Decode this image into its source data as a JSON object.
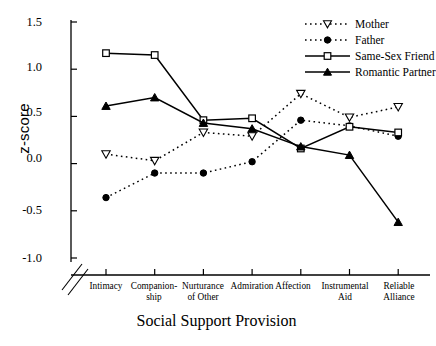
{
  "chart_data": {
    "type": "line",
    "title": "",
    "xlabel": "Social Support Provision",
    "ylabel": "z-score",
    "categories": [
      "Intimacy",
      "Companion-ship",
      "Nurturance of Other",
      "Admiration",
      "Affection",
      "Instrumental Aid",
      "Reliable Alliance"
    ],
    "category_lines": [
      [
        "Intimacy"
      ],
      [
        "Companion-",
        "ship"
      ],
      [
        "Nurturance",
        "of Other"
      ],
      [
        "Admiration"
      ],
      [
        "Affection"
      ],
      [
        "Instrumental",
        "Aid"
      ],
      [
        "Reliable",
        "Alliance"
      ]
    ],
    "ylim": [
      -1.0,
      1.5
    ],
    "yticks": [
      "1.5",
      "1.0",
      "0.5",
      "0.0",
      "-0.5",
      "-1.0"
    ],
    "ytick_values": [
      1.5,
      1.0,
      0.5,
      0.0,
      -0.5,
      -1.0
    ],
    "grid": false,
    "axis_break": true,
    "legend_position": "top-right",
    "series": [
      {
        "name": "Mother",
        "marker": "triangle-down-open",
        "line": "dotted",
        "color": "#000000",
        "values": [
          0.1,
          0.03,
          0.33,
          0.29,
          0.74,
          0.49,
          0.6
        ]
      },
      {
        "name": "Father",
        "marker": "circle-filled",
        "line": "dotted",
        "color": "#000000",
        "values": [
          -0.36,
          -0.1,
          -0.1,
          0.02,
          0.46,
          0.4,
          0.29
        ]
      },
      {
        "name": "Same-Sex Friend",
        "marker": "square-open",
        "line": "solid",
        "color": "#000000",
        "values": [
          1.17,
          1.15,
          0.46,
          0.48,
          0.16,
          0.39,
          0.33
        ]
      },
      {
        "name": "Romantic Partner",
        "marker": "triangle-up-filled",
        "line": "solid",
        "color": "#000000",
        "values": [
          0.61,
          0.7,
          0.43,
          0.37,
          0.18,
          0.09,
          -0.62
        ]
      }
    ]
  },
  "legend": {
    "items": [
      {
        "label": "Mother"
      },
      {
        "label": "Father"
      },
      {
        "label": "Same-Sex Friend"
      },
      {
        "label": "Romantic Partner"
      }
    ]
  }
}
